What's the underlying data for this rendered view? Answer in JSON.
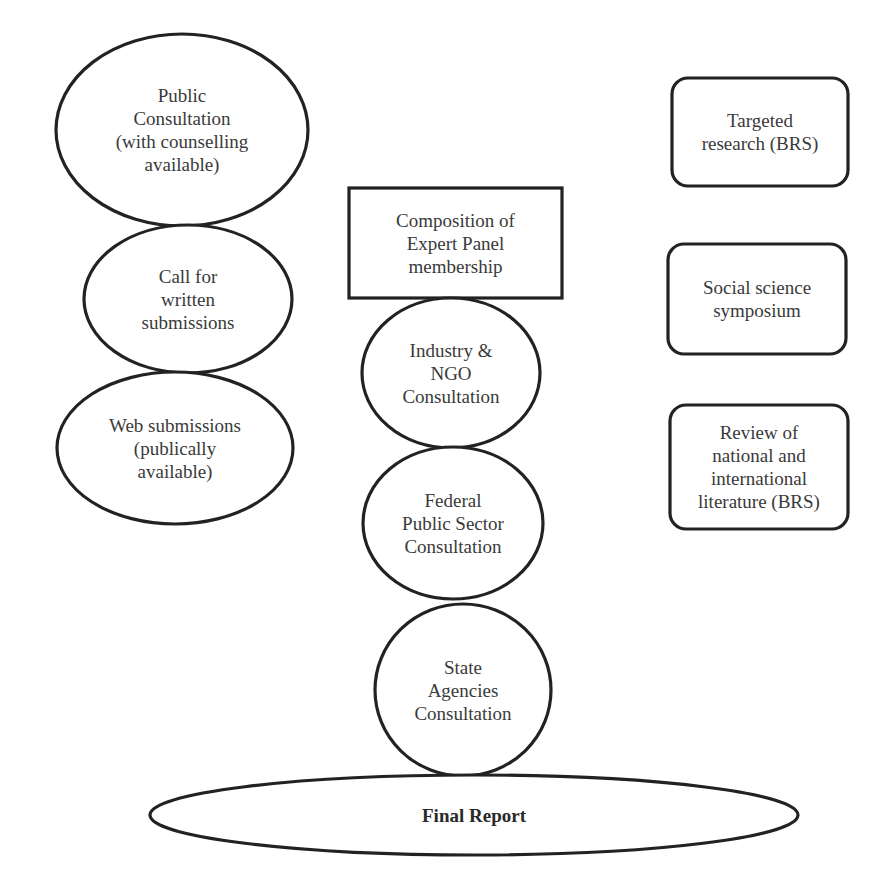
{
  "diagram": {
    "left_column": [
      {
        "id": "public-consultation",
        "shape": "ellipse",
        "cx": 182,
        "cy": 130,
        "rx": 126,
        "ry": 96,
        "lines": [
          "Public",
          "Consultation",
          "(with counselling",
          "available)"
        ]
      },
      {
        "id": "call-for-written-submissions",
        "shape": "ellipse",
        "cx": 188,
        "cy": 299,
        "rx": 104,
        "ry": 74,
        "lines": [
          "Call for",
          "written",
          "submissions"
        ]
      },
      {
        "id": "web-submissions",
        "shape": "ellipse",
        "cx": 175,
        "cy": 448,
        "rx": 118,
        "ry": 76,
        "lines": [
          "Web submissions",
          "(publically",
          "available)"
        ]
      }
    ],
    "middle_column": [
      {
        "id": "expert-panel-composition",
        "shape": "rect",
        "x": 349,
        "y": 188,
        "w": 213,
        "h": 110,
        "lines": [
          "Composition of",
          "Expert Panel",
          "membership"
        ]
      },
      {
        "id": "industry-ngo-consultation",
        "shape": "ellipse",
        "cx": 451,
        "cy": 373,
        "rx": 89,
        "ry": 75,
        "lines": [
          "Industry &",
          "NGO",
          "Consultation"
        ]
      },
      {
        "id": "federal-public-sector-consultation",
        "shape": "ellipse",
        "cx": 453,
        "cy": 523,
        "rx": 90,
        "ry": 76,
        "lines": [
          "Federal",
          "Public Sector",
          "Consultation"
        ]
      },
      {
        "id": "state-agencies-consultation",
        "shape": "ellipse",
        "cx": 463,
        "cy": 690,
        "rx": 88,
        "ry": 86,
        "lines": [
          "State",
          "Agencies",
          "Consultation"
        ]
      }
    ],
    "right_column": [
      {
        "id": "targeted-research",
        "shape": "roundrect",
        "x": 672,
        "y": 78,
        "w": 176,
        "h": 108,
        "lines": [
          "Targeted",
          "research (BRS)"
        ]
      },
      {
        "id": "social-science-symposium",
        "shape": "roundrect",
        "x": 668,
        "y": 244,
        "w": 178,
        "h": 110,
        "lines": [
          "Social science",
          "symposium"
        ]
      },
      {
        "id": "literature-review",
        "shape": "roundrect",
        "x": 670,
        "y": 405,
        "w": 178,
        "h": 124,
        "lines": [
          "Review of",
          "national and",
          "international",
          "literature (BRS)"
        ]
      }
    ],
    "final": {
      "id": "final-report",
      "shape": "ellipse",
      "cx": 474,
      "cy": 815,
      "rx": 324,
      "ry": 40,
      "lines": [
        "Final Report"
      ],
      "bold": true
    },
    "colors": {
      "stroke": "#222222",
      "fill": "#ffffff",
      "text": "#3a3a3a",
      "background": "#ffffff"
    }
  }
}
